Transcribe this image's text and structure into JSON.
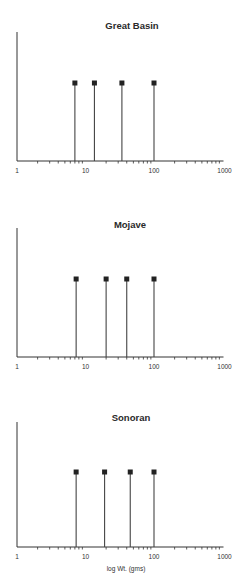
{
  "chart_data": [
    {
      "type": "stem",
      "title": "Great Basin",
      "xscale": "log",
      "xlim": [
        1,
        1000
      ],
      "xticks": [
        "1",
        "10",
        "100",
        "1000"
      ],
      "xlabel": "",
      "ylabel": "",
      "grid": false,
      "x": [
        7,
        13.5,
        34,
        100
      ],
      "values": [
        1,
        1,
        1,
        1
      ]
    },
    {
      "type": "stem",
      "title": "Mojave",
      "xscale": "log",
      "xlim": [
        1,
        1000
      ],
      "xticks": [
        "1",
        "10",
        "100",
        "1000"
      ],
      "xlabel": "",
      "ylabel": "",
      "grid": false,
      "x": [
        7.3,
        20,
        40,
        100
      ],
      "values": [
        1,
        1,
        1,
        1
      ]
    },
    {
      "type": "stem",
      "title": "Sonoran",
      "xscale": "log",
      "xlim": [
        1,
        1000
      ],
      "xticks": [
        "1",
        "10",
        "100",
        "1000"
      ],
      "xlabel": "log Wt. (gms)",
      "ylabel": "",
      "grid": false,
      "x": [
        7.3,
        19,
        45,
        100
      ],
      "values": [
        1,
        1,
        1,
        1
      ]
    }
  ],
  "style": {
    "axis_color": "#333333",
    "stem_color": "#444444",
    "marker_color": "#222222"
  }
}
